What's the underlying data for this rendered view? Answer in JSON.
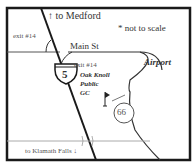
{
  "map": {
    "labels": {
      "to_medford": "↑ to Medford",
      "not_to_scale": "* not to scale",
      "exit_left": "exit #14",
      "main_st": "Main St",
      "exit_right": "exit #14",
      "airport": "Airport",
      "golf_line1": "Oak Knoll",
      "golf_line2": "Public",
      "golf_line3": "GC",
      "to_klamath": "to Klamath Falls ↓",
      "hwy5": "5",
      "hwy66": "66"
    },
    "colors": {
      "border": "#1a1a1a",
      "road": "#222222",
      "minor_road": "#999999",
      "text": "#333333"
    }
  }
}
